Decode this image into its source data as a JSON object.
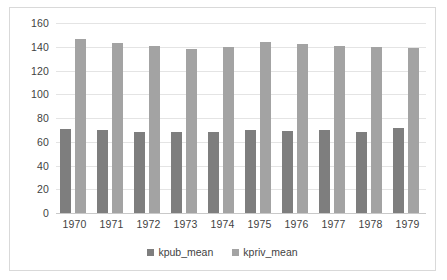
{
  "chart_data": {
    "type": "bar",
    "title": "",
    "xlabel": "",
    "ylabel": "",
    "categories": [
      "1970",
      "1971",
      "1972",
      "1973",
      "1974",
      "1975",
      "1976",
      "1977",
      "1978",
      "1979"
    ],
    "series": [
      {
        "name": "kpub_mean",
        "color": "#7e7e7e",
        "values": [
          71,
          70,
          68.5,
          68,
          68.5,
          70,
          69,
          69.5,
          68.5,
          72
        ]
      },
      {
        "name": "kpriv_mean",
        "color": "#a3a3a3",
        "values": [
          146.5,
          143,
          140.5,
          138.5,
          139.5,
          144,
          142.5,
          141,
          139.5,
          139
        ]
      }
    ],
    "ylim": [
      0,
      160
    ],
    "ytick_step": 20,
    "yticks": [
      "0",
      "20",
      "40",
      "60",
      "80",
      "100",
      "120",
      "140",
      "160"
    ],
    "grid": "horizontal",
    "legend_position": "bottom"
  },
  "legend": {
    "entries": [
      {
        "label": "kpub_mean",
        "marker": "square-marker-icon"
      },
      {
        "label": "kpriv_mean",
        "marker": "square-marker-icon"
      }
    ]
  },
  "colors": {
    "kpub": "#7e7e7e",
    "kpriv": "#a3a3a3",
    "gridline": "#e4e4e4",
    "axis": "#c9c9c9",
    "frame_border": "#d9d9d9",
    "text": "#3f3f3f",
    "background": "#ffffff"
  }
}
